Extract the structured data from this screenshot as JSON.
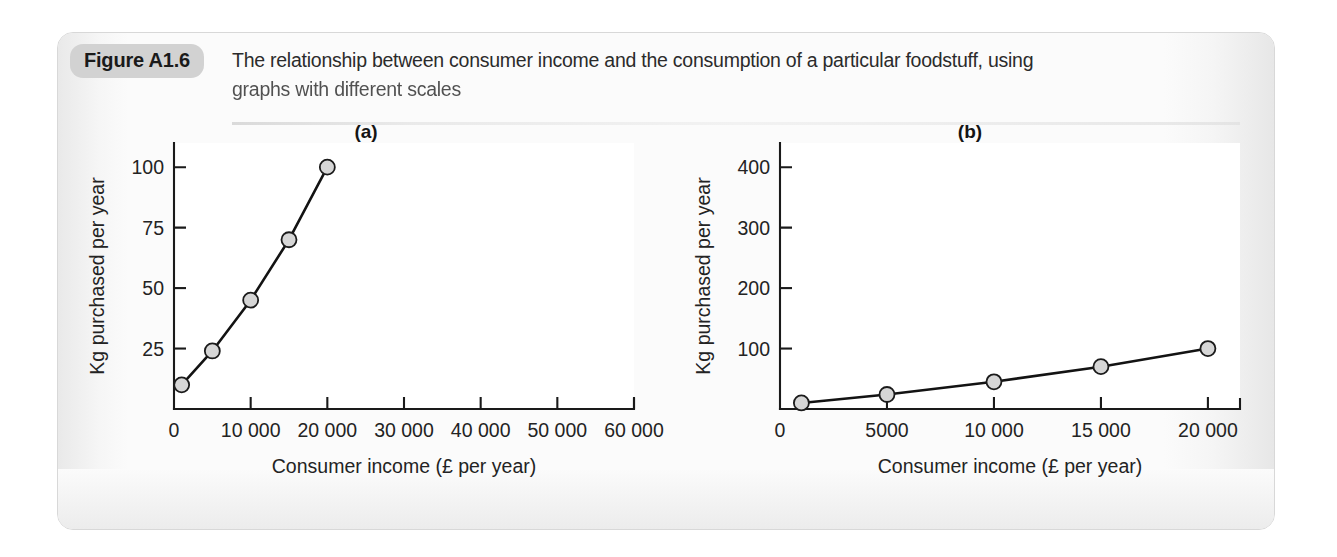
{
  "figure": {
    "badge_label": "Figure A1.6",
    "caption_line1": "The relationship between consumer income and the consumption of a particular foodstuff, using",
    "caption_line2": "graphs with different scales",
    "badge_color": "#d2d2d2",
    "card_background": "#fbfbfb",
    "page_background": "#ffffff"
  },
  "chart_data": [
    {
      "id": "a",
      "panel_label": "(a)",
      "type": "line",
      "title": "",
      "xlabel": "Consumer income (£ per year)",
      "ylabel": "Kg purchased per year",
      "x": [
        1000,
        5000,
        10000,
        15000,
        20000
      ],
      "values": [
        10,
        24,
        45,
        70,
        100
      ],
      "xlim": [
        0,
        60000
      ],
      "ylim": [
        0,
        110
      ],
      "xticks": [
        0,
        10000,
        20000,
        30000,
        40000,
        50000,
        60000
      ],
      "xticklabels": [
        "0",
        "10 000",
        "20 000",
        "30 000",
        "40 000",
        "50 000",
        "60 000"
      ],
      "yticks": [
        25,
        50,
        75,
        100
      ],
      "yticklabels": [
        "25",
        "50",
        "75",
        "100"
      ],
      "grid": false,
      "legend": false,
      "marker": "circle",
      "marker_fill": "#d6d6d6",
      "marker_edge": "#1b1b1b",
      "line_color": "#131313"
    },
    {
      "id": "b",
      "panel_label": "(b)",
      "type": "line",
      "title": "",
      "xlabel": "Consumer income (£ per year)",
      "ylabel": "Kg purchased per year",
      "x": [
        1000,
        5000,
        10000,
        15000,
        20000
      ],
      "values": [
        10,
        24,
        45,
        70,
        100
      ],
      "xlim": [
        0,
        21500
      ],
      "ylim": [
        0,
        440
      ],
      "xticks": [
        0,
        5000,
        10000,
        15000,
        20000
      ],
      "xticklabels": [
        "0",
        "5000",
        "10 000",
        "15 000",
        "20 000"
      ],
      "yticks": [
        100,
        200,
        300,
        400
      ],
      "yticklabels": [
        "100",
        "200",
        "300",
        "400"
      ],
      "grid": false,
      "legend": false,
      "marker": "circle",
      "marker_fill": "#d6d6d6",
      "marker_edge": "#1b1b1b",
      "line_color": "#131313"
    }
  ]
}
